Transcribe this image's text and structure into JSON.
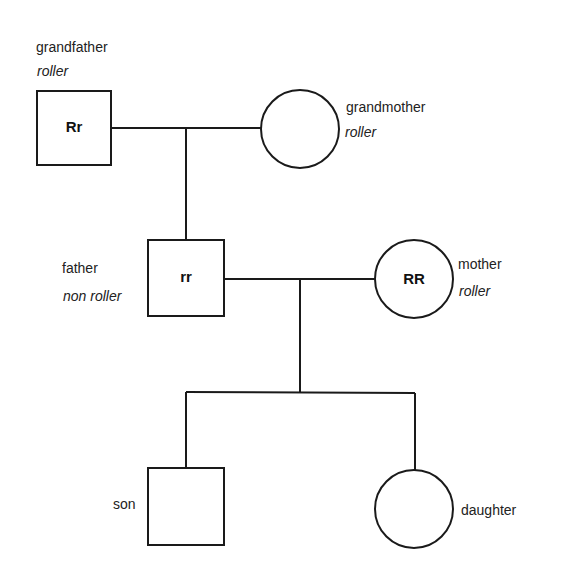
{
  "diagram": {
    "type": "pedigree",
    "trait": "tongue rolling",
    "people": {
      "grandfather": {
        "name": "grandfather",
        "phenotype": "roller",
        "genotype": "Rr",
        "sex": "male"
      },
      "grandmother": {
        "name": "grandmother",
        "phenotype": "roller",
        "genotype": "",
        "sex": "female"
      },
      "father": {
        "name": "father",
        "phenotype": "non roller",
        "genotype": "rr",
        "sex": "male"
      },
      "mother": {
        "name": "mother",
        "phenotype": "roller",
        "genotype": "RR",
        "sex": "female"
      },
      "son": {
        "name": "son",
        "phenotype": "",
        "genotype": "",
        "sex": "male"
      },
      "daughter": {
        "name": "daughter",
        "phenotype": "",
        "genotype": "",
        "sex": "female"
      }
    },
    "relationships": [
      {
        "type": "mating",
        "between": [
          "grandfather",
          "grandmother"
        ],
        "offspring": [
          "father"
        ]
      },
      {
        "type": "mating",
        "between": [
          "father",
          "mother"
        ],
        "offspring": [
          "son",
          "daughter"
        ]
      }
    ],
    "colors": {
      "line": "#1a1a1a",
      "background": "#ffffff"
    }
  }
}
